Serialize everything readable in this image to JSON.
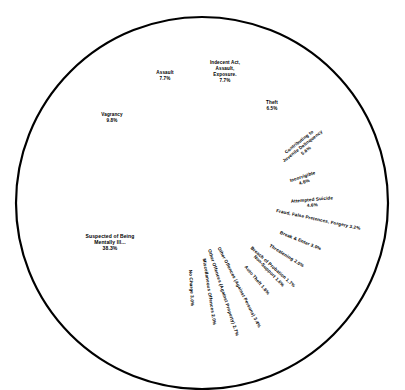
{
  "chart_data": {
    "type": "pie",
    "title": "",
    "subtitle": "",
    "xlabel": "",
    "ylabel": "",
    "legend_position": "none",
    "grid": false,
    "units": "percent",
    "total": 100.0,
    "categories": [
      "Suspected of Being Mentally Ill...",
      "Vagrancy",
      "Assault",
      "Indecent Act, Assault, Exposure.",
      "Theft",
      "Contributing to Juvenile Delinquency",
      "Incorrigible",
      "Attempted Suicide",
      "Fraud, False Pretences, Forgery",
      "Break & Enter",
      "Threatening",
      "Breach of Probation",
      "Auto Theft",
      "Non-Support",
      "Other Offences (Against Persons)",
      "Other Offences (Against Property)",
      "Miscellaneous Offences",
      "No Charge"
    ],
    "values": [
      38.3,
      9.8,
      7.7,
      7.7,
      6.5,
      5.6,
      4.6,
      4.6,
      3.2,
      3.0,
      2.0,
      1.7,
      1.6,
      1.6,
      3.4,
      2.7,
      2.0,
      3.0
    ],
    "slices": [
      {
        "label": "Suspected of Being Mentally Ill...",
        "value": 38.3,
        "value_label": "38.3%",
        "label_lines": [
          "Suspected of Being",
          "Mentally Ill...",
          "38.3%"
        ],
        "label_x": 110,
        "label_y": 238,
        "rotation": 0,
        "anchor": "middle",
        "line_height": 6.0
      },
      {
        "label": "Vagrancy",
        "value": 9.8,
        "value_label": "9.8%",
        "label_lines": [
          "Vagrancy",
          "9.8%"
        ],
        "label_x": 112,
        "label_y": 116,
        "rotation": 0,
        "anchor": "middle",
        "line_height": 6.0
      },
      {
        "label": "Assault",
        "value": 7.7,
        "value_label": "7.7%",
        "label_lines": [
          "Assault",
          "7.7%"
        ],
        "label_x": 165,
        "label_y": 74,
        "rotation": 0,
        "anchor": "middle",
        "line_height": 6.0
      },
      {
        "label": "Indecent Act, Assault, Exposure.",
        "value": 7.7,
        "value_label": "7.7%",
        "label_lines": [
          "Indecent Act,",
          "Assault,",
          "Exposure.",
          "7.7%"
        ],
        "label_x": 225,
        "label_y": 64,
        "rotation": 0,
        "anchor": "middle",
        "line_height": 6.0
      },
      {
        "label": "Theft",
        "value": 6.5,
        "value_label": "6.5%",
        "label_lines": [
          "Theft",
          "6.5%"
        ],
        "label_x": 272,
        "label_y": 104,
        "rotation": 0,
        "anchor": "middle",
        "line_height": 6.0
      },
      {
        "label": "Contributing to Juvenile Delinquency",
        "value": 5.6,
        "value_label": "5.6%",
        "label_lines": [
          "Contributing to",
          "Juvenile Delinquency",
          "5.6%"
        ],
        "label_x": 300,
        "label_y": 143,
        "rotation": -38,
        "anchor": "middle",
        "line_height": 5.6
      },
      {
        "label": "Incorrigible",
        "value": 4.6,
        "value_label": "4.6%",
        "label_lines": [
          "Incorrigible",
          "4.6%"
        ],
        "label_x": 303,
        "label_y": 178,
        "rotation": -18,
        "anchor": "middle",
        "line_height": 5.6
      },
      {
        "label": "Attempted Suicide",
        "value": 4.6,
        "value_label": "4.6%",
        "label_lines": [
          "Attempted Suicide",
          "4.6%"
        ],
        "label_x": 312,
        "label_y": 201,
        "rotation": -5,
        "anchor": "middle",
        "line_height": 5.6
      },
      {
        "label": "Fraud, False Pretences, Forgery",
        "value": 3.2,
        "value_label": "3.2%",
        "label_lines": [
          "Fraud, False Pretences, Forgery 3.2%"
        ],
        "label_x": 318,
        "label_y": 221,
        "rotation": 12,
        "anchor": "middle",
        "line_height": 5.6
      },
      {
        "label": "Break & Enter",
        "value": 3.0,
        "value_label": "3.0%",
        "label_lines": [
          "Break & Enter 3.0%"
        ],
        "label_x": 300,
        "label_y": 242,
        "rotation": 22,
        "anchor": "middle",
        "line_height": 5.6
      },
      {
        "label": "Threatening",
        "value": 2.0,
        "value_label": "2.0%",
        "label_lines": [
          "Threatening 2.0%"
        ],
        "label_x": 286,
        "label_y": 257,
        "rotation": 32,
        "anchor": "middle",
        "line_height": 5.6
      },
      {
        "label": "Breach of Probation",
        "value": 1.7,
        "value_label": "1.7%",
        "label_lines": [
          "Breach of Probation 1.7%"
        ],
        "label_x": 272,
        "label_y": 268,
        "rotation": 42,
        "anchor": "middle",
        "line_height": 5.6
      },
      {
        "label": "Auto Theft",
        "value": 1.6,
        "value_label": "1.6%",
        "label_lines": [
          "Auto Theft 1.6%"
        ],
        "label_x": 256,
        "label_y": 281,
        "rotation": 50,
        "anchor": "middle",
        "line_height": 5.6
      },
      {
        "label": "Non-Support",
        "value": 1.6,
        "value_label": "1.6%",
        "label_lines": [
          "Non-Support 1.6%"
        ],
        "label_x": 268,
        "label_y": 272,
        "rotation": 46,
        "anchor": "middle",
        "line_height": 5.6
      },
      {
        "label": "Other Offences (Against Persons)",
        "value": 3.4,
        "value_label": "3.4%",
        "label_lines": [
          "Other Offences (Against Persons) 3.4%"
        ],
        "label_x": 238,
        "label_y": 288,
        "rotation": 63,
        "anchor": "middle",
        "line_height": 5.6
      },
      {
        "label": "Other Offences (Against Property)",
        "value": 2.7,
        "value_label": "2.7%",
        "label_lines": [
          "Other Offences (Against Property) 2.7%"
        ],
        "label_x": 222,
        "label_y": 293,
        "rotation": 72,
        "anchor": "middle",
        "line_height": 5.6
      },
      {
        "label": "Miscellaneous Offences",
        "value": 2.0,
        "value_label": "2.0%",
        "label_lines": [
          "Miscellaneous Offences 2.0%"
        ],
        "label_x": 208,
        "label_y": 292,
        "rotation": 81,
        "anchor": "middle",
        "line_height": 5.6
      },
      {
        "label": "No Charge",
        "value": 3.0,
        "value_label": "3.0%",
        "label_lines": [
          "No Charge 3.0%"
        ],
        "label_x": 190,
        "label_y": 288,
        "rotation": 87,
        "anchor": "middle",
        "line_height": 5.6
      }
    ],
    "geometry": {
      "center_x": 202,
      "center_y": 203,
      "radius": 186,
      "start_angle_deg": -90,
      "direction": "clockwise"
    },
    "colors": {
      "slice_fill": "#ffffff",
      "outline": "#000000",
      "divider": "#000000",
      "label_text": "#000000",
      "background": "#ffffff"
    }
  }
}
